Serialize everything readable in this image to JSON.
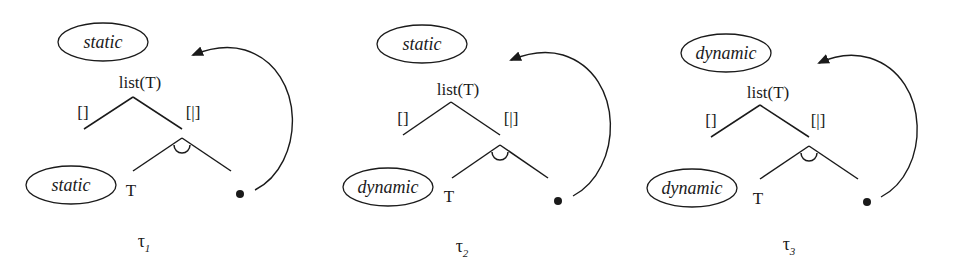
{
  "diagrams": [
    {
      "top_annotation": "static",
      "root_label": "list(T)",
      "left_edge_label": "[]",
      "right_edge_label": "[|]",
      "element_label": "T",
      "element_annotation": "static",
      "caption_symbol": "τ",
      "caption_subscript": "1"
    },
    {
      "top_annotation": "static",
      "root_label": "list(T)",
      "left_edge_label": "[]",
      "right_edge_label": "[|]",
      "element_label": "T",
      "element_annotation": "dynamic",
      "caption_symbol": "τ",
      "caption_subscript": "2"
    },
    {
      "top_annotation": "dynamic",
      "root_label": "list(T)",
      "left_edge_label": "[]",
      "right_edge_label": "[|]",
      "element_label": "T",
      "element_annotation": "dynamic",
      "caption_symbol": "τ",
      "caption_subscript": "3"
    }
  ]
}
